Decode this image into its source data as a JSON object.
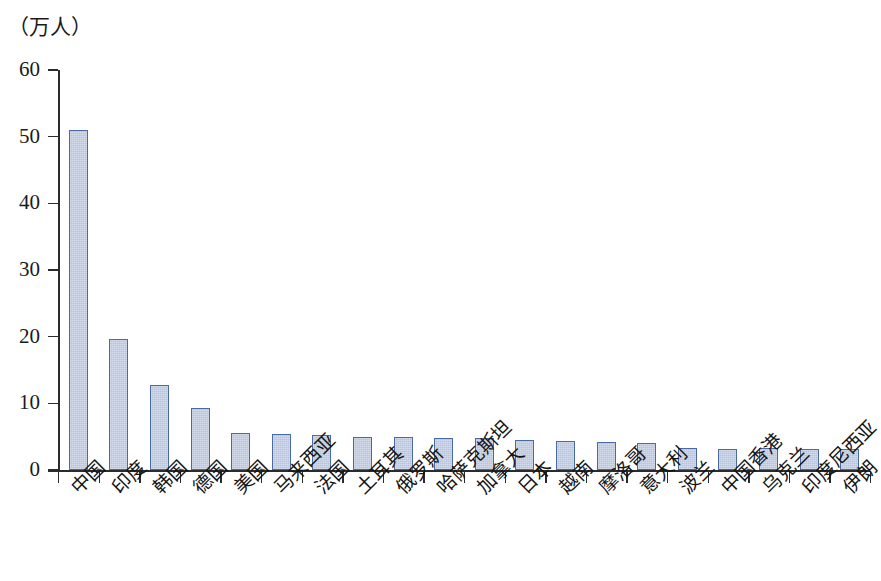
{
  "chart_data": {
    "type": "bar",
    "title": "",
    "subtitle": "",
    "xlabel": "",
    "ylabel": "（万人）",
    "unit_caption": "（万人）",
    "ylim": [
      0,
      60
    ],
    "ytick_values": [
      0,
      10,
      20,
      30,
      40,
      50,
      60
    ],
    "ytick_labels": [
      "0",
      "10",
      "20",
      "30",
      "40",
      "50",
      "60"
    ],
    "grid": false,
    "legend": null,
    "categories": [
      "中国",
      "印度",
      "韩国",
      "德国",
      "美国",
      "马来西亚",
      "法国",
      "土耳其",
      "俄罗斯",
      "哈萨克斯坦",
      "加拿大",
      "日本",
      "越南",
      "摩洛哥",
      "意大利",
      "波兰",
      "中国香港",
      "乌克兰",
      "印度尼西亚",
      "伊朗"
    ],
    "values": [
      51.0,
      19.7,
      12.8,
      9.3,
      5.5,
      5.4,
      5.3,
      4.9,
      4.9,
      4.8,
      4.8,
      4.5,
      4.4,
      4.2,
      4.0,
      3.3,
      3.2,
      3.3,
      3.2,
      3.2
    ],
    "series": [
      {
        "name": "人数",
        "values": [
          51.0,
          19.7,
          12.8,
          9.3,
          5.5,
          5.4,
          5.3,
          4.9,
          4.9,
          4.8,
          4.8,
          4.5,
          4.4,
          4.2,
          4.0,
          3.3,
          3.2,
          3.3,
          3.2,
          3.2
        ]
      }
    ],
    "colors": {
      "bar_fill": "#b7c4de",
      "bar_border": "#4a6aa5",
      "axis": "#2b2b2b",
      "text": "#151515",
      "background": "#ffffff"
    }
  }
}
